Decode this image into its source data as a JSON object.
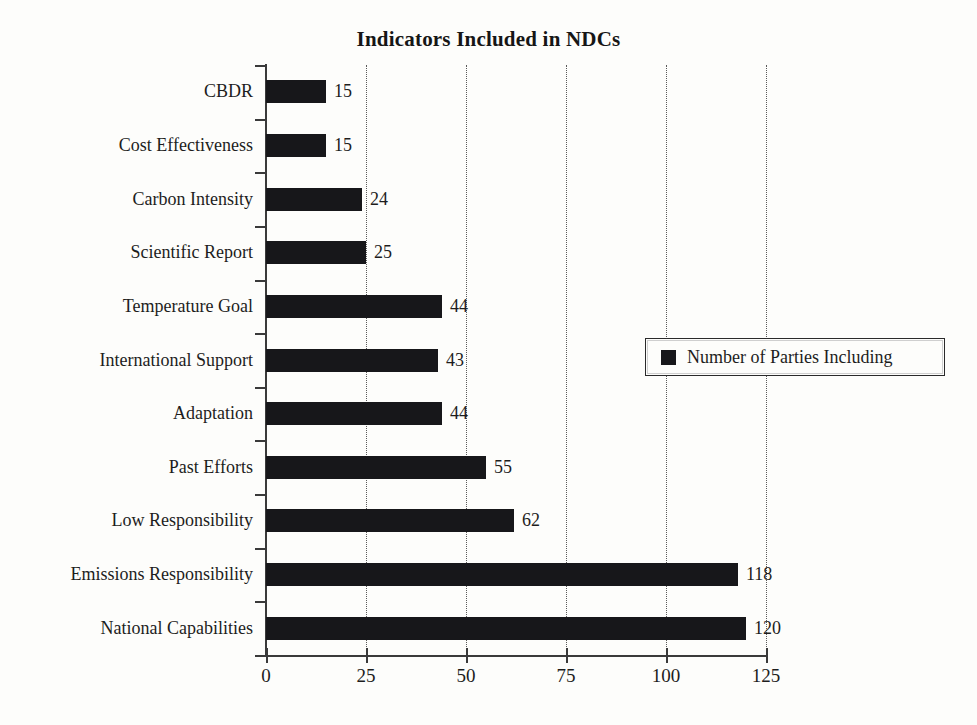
{
  "chart_data": {
    "type": "bar",
    "orientation": "horizontal",
    "title": "Indicators Included in NDCs",
    "xlabel": "",
    "ylabel": "",
    "xlim": [
      0,
      125
    ],
    "grid": "vertical-dotted",
    "legend_position": "middle-right",
    "bar_color": "#17171a",
    "categories": [
      "CBDR",
      "Cost Effectiveness",
      "Carbon Intensity",
      "Scientific Report",
      "Temperature Goal",
      "International Support",
      "Adaptation",
      "Past Efforts",
      "Low Responsibility",
      "Emissions Responsibility",
      "National Capabilities"
    ],
    "values": [
      15,
      15,
      24,
      25,
      44,
      43,
      44,
      55,
      62,
      118,
      120
    ],
    "series": [
      {
        "name": "Number of Parties Including",
        "values": [
          15,
          15,
          24,
          25,
          44,
          43,
          44,
          55,
          62,
          118,
          120
        ]
      }
    ],
    "xticks": [
      0,
      25,
      50,
      75,
      100,
      125
    ],
    "xtick_labels": [
      "0",
      "25",
      "50",
      "75",
      "100",
      "125"
    ],
    "value_labels": [
      "15",
      "15",
      "24",
      "25",
      "44",
      "43",
      "44",
      "55",
      "62",
      "118",
      "120"
    ]
  },
  "legend": {
    "entries": [
      {
        "label": "Number of Parties Including",
        "color": "#17171a",
        "marker": "square"
      }
    ]
  }
}
